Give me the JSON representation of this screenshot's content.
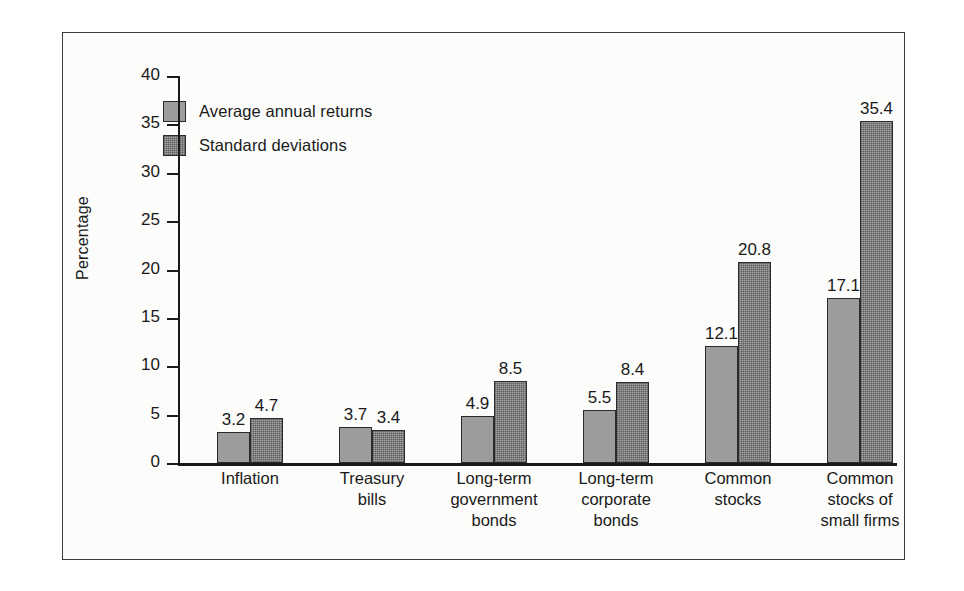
{
  "chart_data": {
    "type": "bar",
    "title": "",
    "xlabel": "",
    "ylabel": "Percentage",
    "ylim": [
      0,
      40
    ],
    "ytick_step": 5,
    "yticks": [
      "40",
      "35",
      "30",
      "25",
      "20",
      "15",
      "10",
      "5",
      "0"
    ],
    "grid": false,
    "legend_position": "upper-left-inside",
    "categories": [
      "Inflation",
      "Treasury\nbills",
      "Long-term\ngovernment\nbonds",
      "Long-term\ncorporate\nbonds",
      "Common\nstocks",
      "Common\nstocks of\nsmall firms"
    ],
    "series": [
      {
        "name": "Average annual returns",
        "color": "#9c9c9c",
        "values": [
          3.2,
          3.7,
          4.9,
          5.5,
          12.1,
          17.1
        ],
        "labels": [
          "3.2",
          "3.7",
          "4.9",
          "5.5",
          "12.1",
          "17.1"
        ]
      },
      {
        "name": "Standard deviations",
        "color": "#8a8a8a",
        "values": [
          4.7,
          3.4,
          8.5,
          8.4,
          20.8,
          35.4
        ],
        "labels": [
          "4.7",
          "3.4",
          "8.5",
          "8.4",
          "20.8",
          "35.4"
        ]
      }
    ]
  },
  "legend": {
    "items": [
      {
        "label": "Average annual returns"
      },
      {
        "label": "Standard deviations"
      }
    ]
  },
  "category_lines": [
    [
      "Inflation"
    ],
    [
      "Treasury",
      "bills"
    ],
    [
      "Long-term",
      "government",
      "bonds"
    ],
    [
      "Long-term",
      "corporate",
      "bonds"
    ],
    [
      "Common",
      "stocks"
    ],
    [
      "Common",
      "stocks of",
      "small firms"
    ]
  ]
}
